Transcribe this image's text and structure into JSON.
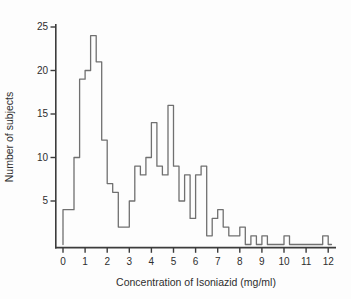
{
  "chart_data": {
    "type": "bar",
    "subtype": "histogram-step-outline",
    "title": "",
    "xlabel": "Concentration of Isoniazid (mg/ml)",
    "ylabel": "Number of subjects",
    "x_tick_labels": [
      "0",
      "1",
      "2",
      "3",
      "4",
      "5",
      "6",
      "7",
      "8",
      "9",
      "10",
      "11",
      "12"
    ],
    "x_tick_values": [
      0,
      1,
      2,
      3,
      4,
      5,
      6,
      7,
      8,
      9,
      10,
      11,
      12
    ],
    "y_tick_labels": [
      "5",
      "10",
      "15",
      "20",
      "25"
    ],
    "y_tick_values": [
      5,
      10,
      15,
      20,
      25
    ],
    "xlim": [
      0,
      12.3
    ],
    "ylim": [
      0,
      25
    ],
    "grid": false,
    "legend": "none",
    "bin_start": 0,
    "bin_width": 0.25,
    "counts": [
      4,
      4,
      10,
      19,
      20,
      24,
      21,
      12,
      7,
      6,
      2,
      2,
      5,
      9,
      8,
      10,
      14,
      9,
      8,
      16,
      9,
      5,
      8,
      3,
      8,
      9,
      1,
      3,
      4,
      2,
      1,
      1,
      2,
      0,
      1,
      0,
      1,
      0,
      0,
      0,
      1,
      0,
      0,
      0,
      0,
      0,
      0,
      1
    ],
    "distribution_note": "bimodal",
    "colors": {
      "axis": "#3c3c3c",
      "step_line": "#707070",
      "text": "#2e2e2e",
      "background": "#fdfdfd"
    }
  }
}
